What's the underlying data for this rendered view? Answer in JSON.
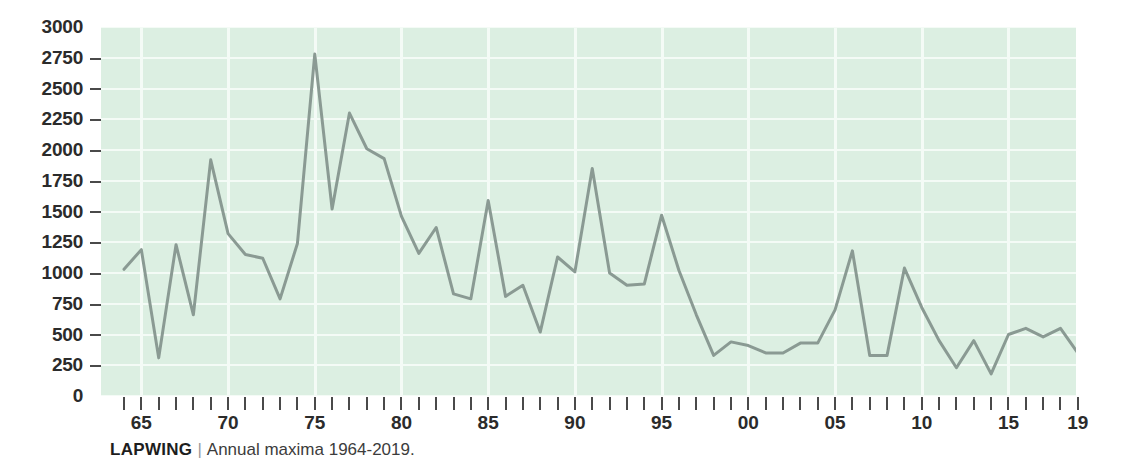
{
  "caption": {
    "species": "LAPWING",
    "separator": "|",
    "description": "Annual maxima 1964-2019."
  },
  "colors": {
    "plot_background": "#dcefe2",
    "gridline": "#f4fbf6",
    "line": "#8a9a93",
    "axis_text": "#2b2b2b",
    "page_background": "#ffffff"
  },
  "axes": {
    "y_ticks": [
      "3000",
      "2750",
      "2500",
      "2250",
      "2000",
      "1750",
      "1500",
      "1250",
      "1000",
      "750",
      "500",
      "250",
      "0"
    ],
    "x_tick_labels": [
      {
        "year": 1965,
        "label": "65"
      },
      {
        "year": 1970,
        "label": "70"
      },
      {
        "year": 1975,
        "label": "75"
      },
      {
        "year": 1980,
        "label": "80"
      },
      {
        "year": 1985,
        "label": "85"
      },
      {
        "year": 1990,
        "label": "90"
      },
      {
        "year": 1995,
        "label": "95"
      },
      {
        "year": 2000,
        "label": "00"
      },
      {
        "year": 2005,
        "label": "05"
      },
      {
        "year": 2010,
        "label": "10"
      },
      {
        "year": 2015,
        "label": "15"
      },
      {
        "year": 2019,
        "label": "19"
      }
    ]
  },
  "chart_data": {
    "type": "line",
    "title": "LAPWING",
    "subtitle": "Annual maxima 1964-2019.",
    "xlabel": "",
    "ylabel": "",
    "xlim": [
      1964,
      2019
    ],
    "ylim": [
      0,
      3000
    ],
    "ytick_step": 250,
    "grid": true,
    "legend": "none",
    "x": [
      1964,
      1965,
      1966,
      1967,
      1968,
      1969,
      1970,
      1971,
      1972,
      1973,
      1974,
      1975,
      1976,
      1977,
      1978,
      1979,
      1980,
      1981,
      1982,
      1983,
      1984,
      1985,
      1986,
      1987,
      1988,
      1989,
      1990,
      1991,
      1992,
      1993,
      1994,
      1995,
      1996,
      1997,
      1998,
      1999,
      2000,
      2001,
      2002,
      2003,
      2004,
      2005,
      2006,
      2007,
      2008,
      2009,
      2010,
      2011,
      2012,
      2013,
      2014,
      2015,
      2016,
      2017,
      2018,
      2019
    ],
    "values": [
      1030,
      1190,
      310,
      1230,
      660,
      1920,
      1320,
      1150,
      1120,
      790,
      1240,
      2780,
      1520,
      2300,
      2010,
      1930,
      1460,
      1160,
      1370,
      830,
      790,
      1590,
      810,
      900,
      520,
      1130,
      1010,
      1850,
      1000,
      900,
      910,
      1470,
      1020,
      660,
      330,
      440,
      410,
      350,
      350,
      430,
      430,
      700,
      1180,
      330,
      330,
      1040,
      720,
      450,
      230,
      450,
      180,
      500,
      550,
      480,
      550,
      350
    ],
    "series": [
      {
        "name": "Lapwing annual maxima",
        "color": "#8a9a93",
        "values": [
          1030,
          1190,
          310,
          1230,
          660,
          1920,
          1320,
          1150,
          1120,
          790,
          1240,
          2780,
          1520,
          2300,
          2010,
          1930,
          1460,
          1160,
          1370,
          830,
          790,
          1590,
          810,
          900,
          520,
          1130,
          1010,
          1850,
          1000,
          900,
          910,
          1470,
          1020,
          660,
          330,
          440,
          410,
          350,
          350,
          430,
          430,
          700,
          1180,
          330,
          330,
          1040,
          720,
          450,
          230,
          450,
          180,
          500,
          550,
          480,
          550,
          350
        ]
      }
    ]
  }
}
